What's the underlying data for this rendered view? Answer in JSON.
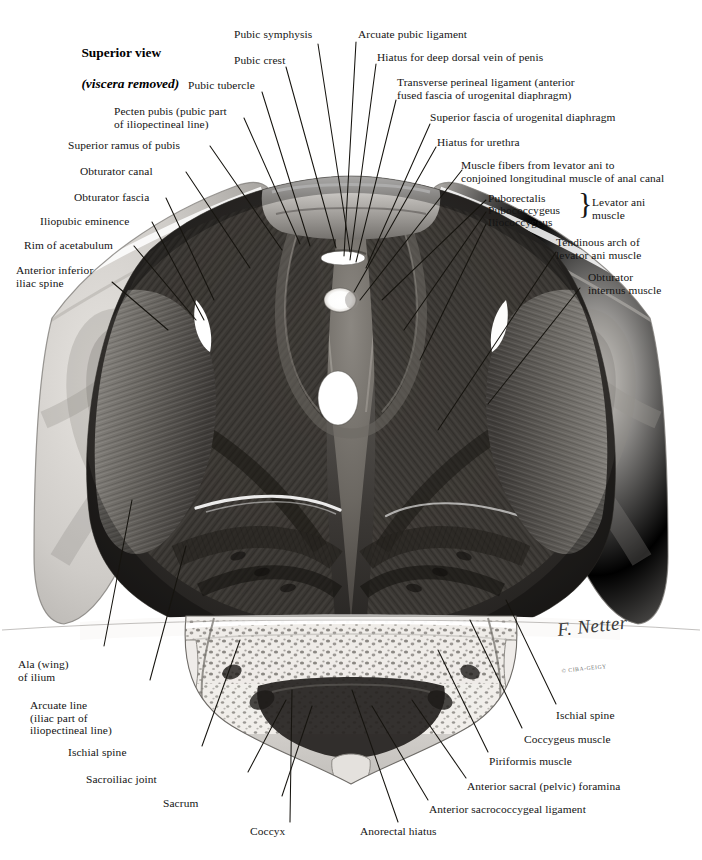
{
  "plate": {
    "title_line1": "Superior view",
    "title_line2": "(viscera removed)",
    "top_cut_text": "",
    "background": "#ffffff",
    "ink": "#141414"
  },
  "signature": {
    "name": "F. Netter",
    "credit": "© CIBA-GEIGY"
  },
  "grouping": {
    "brace_glyph": "}",
    "brace_label_line1": "Levator ani",
    "brace_label_line2": "muscle"
  },
  "labels_left": [
    {
      "id": "pecten-pubis",
      "text": "Pecten pubis (pubic part\nof iliopectineal line)"
    },
    {
      "id": "superior-ramus-of-pubis",
      "text": "Superior ramus of pubis"
    },
    {
      "id": "obturator-canal",
      "text": "Obturator canal"
    },
    {
      "id": "obturator-fascia",
      "text": "Obturator fascia"
    },
    {
      "id": "iliopubic-eminence",
      "text": "Iliopubic eminence"
    },
    {
      "id": "rim-of-acetabulum",
      "text": "Rim of acetabulum"
    },
    {
      "id": "anterior-inferior-iliac-spine",
      "text": "Anterior inferior\niliac spine"
    },
    {
      "id": "ala-wing-of-ilium",
      "text": "Ala (wing)\nof ilium"
    },
    {
      "id": "arcuate-line",
      "text": "Arcuate line\n(iliac part of\niliopectineal line)"
    },
    {
      "id": "ischial-spine-left",
      "text": "Ischial spine"
    },
    {
      "id": "sacroiliac-joint",
      "text": "Sacroiliac joint"
    },
    {
      "id": "sacrum",
      "text": "Sacrum"
    }
  ],
  "labels_top": [
    {
      "id": "pubic-symphysis",
      "text": "Pubic symphysis"
    },
    {
      "id": "pubic-crest",
      "text": "Pubic crest"
    },
    {
      "id": "pubic-tubercle",
      "text": "Pubic tubercle"
    }
  ],
  "labels_right": [
    {
      "id": "arcuate-pubic-ligament",
      "text": "Arcuate pubic ligament"
    },
    {
      "id": "hiatus-deep-dorsal-vein",
      "text": "Hiatus for deep dorsal vein of penis"
    },
    {
      "id": "transverse-perineal-ligament",
      "text": "Transverse perineal ligament (anterior\nfused fascia of urogenital diaphragm)"
    },
    {
      "id": "superior-fascia-urogenital-diaphragm",
      "text": "Superior fascia of urogenital diaphragm"
    },
    {
      "id": "hiatus-for-urethra",
      "text": "Hiatus for urethra"
    },
    {
      "id": "muscle-fibers-levator-ani",
      "text": "Muscle fibers from levator ani to\nconjoined longitudinal muscle of anal canal"
    },
    {
      "id": "puborectalis",
      "text": "Puborectalis"
    },
    {
      "id": "pubococcygeus",
      "text": "Pubococcygeus"
    },
    {
      "id": "iliococcygeus",
      "text": "Iliococcygeus"
    },
    {
      "id": "tendinous-arch-levator-ani",
      "text": "Tendinous arch of\nlevator ani muscle"
    },
    {
      "id": "obturator-internus-muscle",
      "text": "Obturator\ninternus muscle"
    }
  ],
  "labels_bottom": [
    {
      "id": "ischial-spine-right",
      "text": "Ischial spine"
    },
    {
      "id": "coccygeus-muscle",
      "text": "Coccygeus muscle"
    },
    {
      "id": "piriformis-muscle",
      "text": "Piriformis muscle"
    },
    {
      "id": "anterior-sacral-foramina",
      "text": "Anterior sacral (pelvic) foramina"
    },
    {
      "id": "anterior-sacrococcygeal-ligament",
      "text": "Anterior sacrococcygeal ligament"
    },
    {
      "id": "anorectal-hiatus",
      "text": "Anorectal hiatus"
    },
    {
      "id": "coccyx",
      "text": "Coccyx"
    }
  ]
}
